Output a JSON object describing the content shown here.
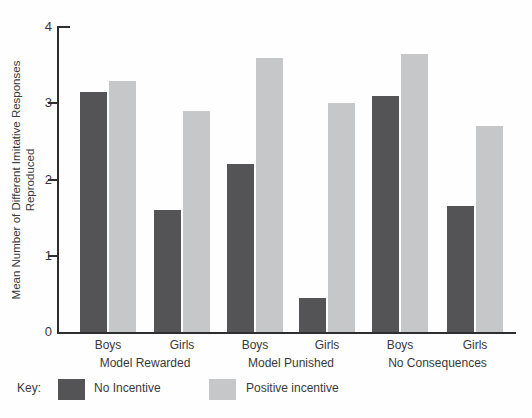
{
  "chart_data": {
    "type": "bar",
    "title": "",
    "ylabel": "Mean Number of Different Imitative Responses Reproduced",
    "ylabel_lines": [
      "Mean Number of Different Imitative Responses",
      "Reproduced"
    ],
    "ylim": [
      0,
      4
    ],
    "yticks": [
      0,
      1,
      2,
      3,
      4
    ],
    "grid": false,
    "axis_color": "#2e2e30",
    "text_color": "#39393b",
    "series": [
      {
        "name": "No Incentive",
        "color": "#545457"
      },
      {
        "name": "Positive incentive",
        "color": "#c6c7c8"
      }
    ],
    "conditions": [
      "Model Rewarded",
      "Model Punished",
      "No Consequences"
    ],
    "pairs": [
      {
        "condition": "Model Rewarded",
        "sex": "Boys",
        "no_incentive": 3.15,
        "positive_incentive": 3.3
      },
      {
        "condition": "Model Rewarded",
        "sex": "Girls",
        "no_incentive": 1.6,
        "positive_incentive": 2.9
      },
      {
        "condition": "Model Punished",
        "sex": "Boys",
        "no_incentive": 2.2,
        "positive_incentive": 3.6
      },
      {
        "condition": "Model Punished",
        "sex": "Girls",
        "no_incentive": 0.45,
        "positive_incentive": 3.0
      },
      {
        "condition": "No Consequences",
        "sex": "Boys",
        "no_incentive": 3.1,
        "positive_incentive": 3.65
      },
      {
        "condition": "No Consequences",
        "sex": "Girls",
        "no_incentive": 1.65,
        "positive_incentive": 2.7
      }
    ],
    "legend": {
      "key_label": "Key:",
      "position": "bottom",
      "entries": [
        {
          "label": "No Incentive",
          "color": "#545457"
        },
        {
          "label": "Positive incentive",
          "color": "#c6c7c8"
        }
      ]
    }
  }
}
